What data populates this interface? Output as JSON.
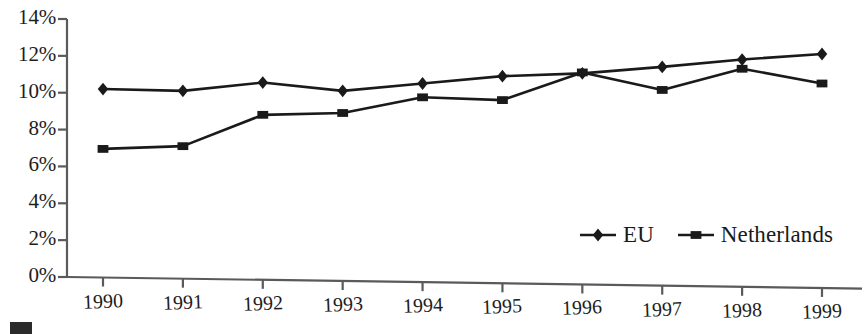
{
  "chart_data": {
    "type": "line",
    "title": "",
    "subtitle": "",
    "xlabel": "",
    "ylabel": "",
    "categories": [
      "1990",
      "1991",
      "1992",
      "1993",
      "1994",
      "1995",
      "1996",
      "1997",
      "1998",
      "1999"
    ],
    "series": [
      {
        "name": "EU",
        "marker": "diamond",
        "color": "#1a1a1a",
        "values": [
          10.2,
          10.1,
          10.55,
          10.1,
          10.5,
          10.9,
          11.05,
          11.4,
          11.8,
          12.1
        ]
      },
      {
        "name": "Netherlands",
        "marker": "square",
        "color": "#1a1a1a",
        "values": [
          6.95,
          7.1,
          8.8,
          8.9,
          9.75,
          9.6,
          11.1,
          10.15,
          11.3,
          10.5
        ]
      }
    ],
    "ylim": [
      0,
      14
    ],
    "ytick_values": [
      0,
      2,
      4,
      6,
      8,
      10,
      12,
      14
    ],
    "ytick_labels": [
      "0%",
      "2%",
      "4%",
      "6%",
      "8%",
      "10%",
      "12%",
      "14%"
    ],
    "xtick_labels": [
      "1990",
      "1991",
      "1992",
      "1993",
      "1994",
      "1995",
      "1996",
      "1997",
      "1998",
      "1999"
    ],
    "grid": false,
    "legend_position": "bottom-right",
    "legend_entries": [
      "EU",
      "Netherlands"
    ],
    "axis_color": "#5a5a5a",
    "line_color": "#1a1a1a",
    "background": "#ffffff"
  }
}
